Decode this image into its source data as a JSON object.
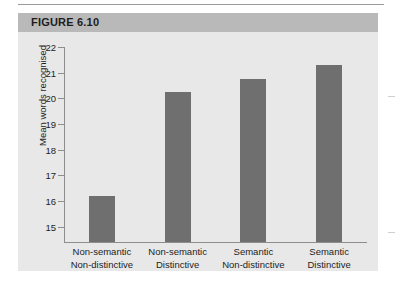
{
  "figure": {
    "title": "FIGURE 6.10",
    "header_color": "#b9b9b9",
    "body_color": "#e8e8e8"
  },
  "chart_data": {
    "type": "bar",
    "title": "FIGURE 6.10",
    "xlabel": "",
    "ylabel": "Mean words recognised",
    "categories": [
      "Non-semantic\nNon-distinctive",
      "Non-semantic\nDistinctive",
      "Semantic\nNon-distinctive",
      "Semantic\nDistinctive"
    ],
    "category_lines": [
      [
        "Non-semantic",
        "Non-distinctive"
      ],
      [
        "Non-semantic",
        "Distinctive"
      ],
      [
        "Semantic",
        "Non-distinctive"
      ],
      [
        "Semantic",
        "Distinctive"
      ]
    ],
    "values": [
      16.2,
      20.25,
      20.75,
      21.3
    ],
    "ylim": [
      14.4,
      22
    ],
    "yticks": [
      15,
      16,
      17,
      18,
      19,
      20,
      21,
      22
    ],
    "ytick_labels": [
      "15",
      "16",
      "17",
      "18",
      "19",
      "20",
      "21",
      "22"
    ],
    "grid": false,
    "legend": null,
    "bar_color": "#6f6f6f",
    "axis_color": "#8d8d8d"
  }
}
